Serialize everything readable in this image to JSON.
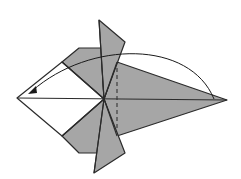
{
  "diagram": {
    "type": "origami-fold-step",
    "colors": {
      "paper_colored_side": "#a6a6a6",
      "paper_white_side": "#ffffff",
      "line": "#2b2b2b",
      "background": "#ffffff"
    },
    "elements": {
      "left_white_kite": "white-side diamond at left",
      "top_flap": "upper pointed flap",
      "bottom_flap": "lower pointed flap",
      "right_point": "long gray point at right",
      "valley_fold_line": "dashed vertical line",
      "fold_arrow": "curved arrow from right point to left point"
    }
  }
}
